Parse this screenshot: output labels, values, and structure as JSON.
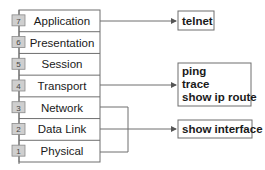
{
  "layers": [
    {
      "number": "7",
      "name": "Application"
    },
    {
      "number": "6",
      "name": "Presentation"
    },
    {
      "number": "5",
      "name": "Session"
    },
    {
      "number": "4",
      "name": "Transport"
    },
    {
      "number": "3",
      "name": "Network"
    },
    {
      "number": "2",
      "name": "Data Link"
    },
    {
      "number": "1",
      "name": "Physical"
    }
  ],
  "commands": [
    {
      "id": "application",
      "lines": [
        "telnet"
      ]
    },
    {
      "id": "transport",
      "lines": [
        "ping",
        "trace",
        "show ip route"
      ]
    },
    {
      "id": "datalink-physical",
      "lines": [
        "show interface"
      ]
    }
  ],
  "colors": {
    "line": "#6e6e6e",
    "badge_fill": "#cfcfcf",
    "arrow": "#555555"
  }
}
